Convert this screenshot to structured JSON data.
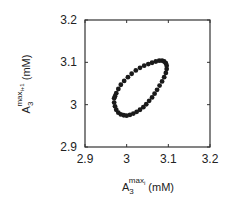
{
  "chart_data": {
    "type": "scatter",
    "title": "",
    "xlabel": "A3^max_i (mM)",
    "ylabel": "A3^max_i+1 (mM)",
    "xlabel_parts": {
      "base": "A",
      "sub": "3",
      "sup": "max",
      "supsub": "i",
      "unit": " (mM)"
    },
    "ylabel_parts": {
      "base": "A",
      "sub": "3",
      "sup": "max",
      "supsub": "i+1",
      "unit": " (mM)"
    },
    "xlim": [
      2.9,
      3.2
    ],
    "ylim": [
      2.9,
      3.2
    ],
    "xticks": [
      2.9,
      3.0,
      3.1,
      3.2
    ],
    "yticks": [
      2.9,
      3.0,
      3.1,
      3.2
    ],
    "xtick_labels": [
      "2.9",
      "3",
      "3.1",
      "3.2"
    ],
    "ytick_labels": [
      "2.9",
      "3",
      "3.1",
      "3.2"
    ],
    "grid": false,
    "legend": null,
    "marker_color": "#1a1a1a",
    "series": [
      {
        "name": "return map",
        "x": [
          2.97,
          2.97,
          2.972,
          2.975,
          2.98,
          2.986,
          2.993,
          3.0,
          3.008,
          3.016,
          3.024,
          3.032,
          3.04,
          3.047,
          3.054,
          3.061,
          3.067,
          3.073,
          3.079,
          3.085,
          3.09,
          3.094,
          3.096,
          3.096,
          3.094,
          3.09,
          3.085,
          3.078,
          3.07,
          3.061,
          3.052,
          3.042,
          3.032,
          3.022,
          3.012,
          3.003,
          2.994,
          2.986,
          2.98,
          2.975,
          2.972
        ],
        "y": [
          3.015,
          3.005,
          2.996,
          2.988,
          2.981,
          2.977,
          2.975,
          2.974,
          2.976,
          2.979,
          2.983,
          2.988,
          2.994,
          3.001,
          3.009,
          3.017,
          3.026,
          3.035,
          3.045,
          3.055,
          3.065,
          3.075,
          3.084,
          3.092,
          3.098,
          3.102,
          3.104,
          3.104,
          3.102,
          3.099,
          3.096,
          3.092,
          3.087,
          3.081,
          3.073,
          3.065,
          3.056,
          3.047,
          3.037,
          3.027,
          3.02
        ]
      }
    ]
  }
}
